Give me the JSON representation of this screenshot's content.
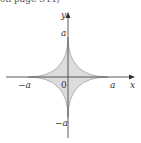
{
  "caption": "on page 344)",
  "diagram": {
    "type": "astroid",
    "equation_hint": "x^(2/3) + y^(2/3) = a^(2/3)",
    "fill_color": "#dcdcdc",
    "stroke_color": "#888888",
    "axis_color": "#333333",
    "labels": {
      "x_axis": "x",
      "y_axis": "y",
      "pos_a_x": "a",
      "neg_a_x": "−a",
      "pos_a_y": "a",
      "neg_a_y": "−a",
      "origin": "0"
    }
  }
}
